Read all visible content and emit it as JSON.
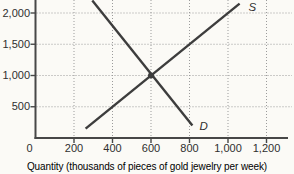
{
  "figure": {
    "background": "#fbfaf6",
    "line_color": "#3d3d3d",
    "axis_color": "#474747",
    "grid_color": "#9b9b9b",
    "text_color": "#2f2f2f"
  },
  "chart_data": {
    "type": "line",
    "title": "",
    "xlabel": "Quantity (thousands of pieces of gold jewelry per week)",
    "ylabel": "",
    "xlim": [
      0,
      1340
    ],
    "ylim": [
      0,
      2210
    ],
    "grid": "dotted",
    "legend": "none",
    "x_ticks": [
      {
        "value": 0,
        "label": "0"
      },
      {
        "value": 200,
        "label": "200"
      },
      {
        "value": 400,
        "label": "400"
      },
      {
        "value": 600,
        "label": "600"
      },
      {
        "value": 800,
        "label": "800"
      },
      {
        "value": 1000,
        "label": "1,000"
      },
      {
        "value": 1200,
        "label": "1,200"
      }
    ],
    "y_ticks": [
      {
        "value": 500,
        "label": "500"
      },
      {
        "value": 1000,
        "label": "1,000"
      },
      {
        "value": 1500,
        "label": "1,500"
      },
      {
        "value": 2000,
        "label": "2,000"
      }
    ],
    "series": [
      {
        "name": "demand",
        "label": "D",
        "points": [
          [
            295,
            2200
          ],
          [
            815,
            200
          ]
        ],
        "label_offset": [
          7,
          4
        ]
      },
      {
        "name": "supply",
        "label": "S",
        "points": [
          [
            260,
            150
          ],
          [
            1060,
            2150
          ]
        ],
        "label_offset": [
          9,
          7
        ]
      }
    ],
    "equilibrium": {
      "x": 600,
      "y": 1000,
      "marker": "dot"
    }
  }
}
